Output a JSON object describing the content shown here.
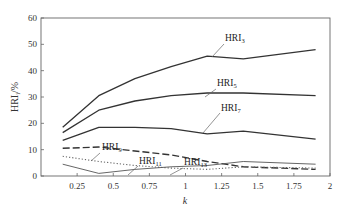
{
  "chart_data": {
    "type": "line",
    "title": "",
    "xlabel": "k",
    "ylabel": "HRI_i /%",
    "ylabel_main": "HRI",
    "ylabel_sub": "i",
    "ylabel_unit": "/%",
    "xlim": [
      0,
      2
    ],
    "ylim": [
      0,
      60
    ],
    "grid": false,
    "legend_position": "inline labels with leader lines",
    "x_ticks": [
      0.25,
      0.5,
      0.75,
      1,
      1.25,
      1.5,
      1.75,
      2
    ],
    "x_tick_labels": [
      "0.25",
      "0.5",
      "0.75",
      "1",
      "1.25",
      "1.5",
      "1.75",
      "2"
    ],
    "y_ticks": [
      0,
      10,
      20,
      30,
      40,
      50,
      60
    ],
    "y_tick_labels": [
      "0",
      "10",
      "20",
      "30",
      "40",
      "50",
      "60"
    ],
    "x": [
      0.15,
      0.4,
      0.65,
      0.9,
      1.15,
      1.4,
      1.9
    ],
    "series": [
      {
        "name": "HRI3",
        "label_main": "HRI",
        "label_sub": "3",
        "style": "solid",
        "values": [
          18.5,
          30.5,
          37,
          41.5,
          45.5,
          44.5,
          48
        ]
      },
      {
        "name": "HRI5",
        "label_main": "HRI",
        "label_sub": "5",
        "style": "solid",
        "values": [
          16.5,
          25,
          28.5,
          30.5,
          31.5,
          31.5,
          30.5
        ]
      },
      {
        "name": "HRI7",
        "label_main": "HRI",
        "label_sub": "7",
        "style": "solid",
        "values": [
          13.5,
          18.5,
          18.5,
          18,
          16,
          17,
          14
        ]
      },
      {
        "name": "HRI9",
        "label_main": "HRI",
        "label_sub": "9",
        "style": "dashed",
        "values": [
          10.5,
          11,
          9.5,
          8,
          5.5,
          3.5,
          2.5
        ]
      },
      {
        "name": "HRI11",
        "label_main": "HRI",
        "label_sub": "11",
        "style": "dotted",
        "values": [
          7.5,
          5.5,
          4,
          3,
          2.5,
          3.5,
          3
        ]
      },
      {
        "name": "HRI13",
        "label_main": "HRI",
        "label_sub": "13",
        "style": "thin-solid",
        "values": [
          4.5,
          1,
          2.5,
          3.5,
          4,
          5.5,
          4.5
        ]
      }
    ]
  }
}
